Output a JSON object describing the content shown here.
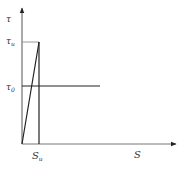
{
  "diagram": {
    "type": "bilinear stress-slip diagram",
    "axes": {
      "y_label": "τ",
      "x_label": "S",
      "color": "#444444"
    },
    "labels": {
      "tau_u": {
        "main": "τ",
        "sub": "u"
      },
      "tau_0": {
        "main": "τ",
        "sub": "0"
      },
      "s_u": {
        "main": "S",
        "sub": "u"
      }
    },
    "colors": {
      "axis": "#555555",
      "curve": "#222222",
      "reference_line": "#999999"
    },
    "geometry": {
      "origin": [
        22,
        144
      ],
      "peak": [
        39,
        42
      ],
      "tau0_y": 86,
      "tau0_end_x": 100,
      "x_axis_end": 176,
      "y_axis_top": 7
    }
  }
}
